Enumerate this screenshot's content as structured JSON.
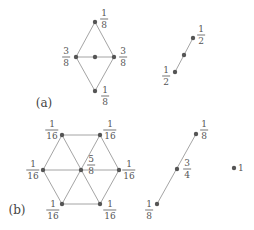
{
  "diagram": {
    "colors": {
      "edge": "#9a9a9a",
      "node": "#555555",
      "text": "#555555"
    },
    "panels": [
      {
        "label": "(a)",
        "label_pos": [
          44,
          103
        ],
        "figures": [
          {
            "name": "diamond",
            "nodes": [
              {
                "id": "top",
                "x": 95,
                "y": 22,
                "label": {
                  "num": "1",
                  "den": "8"
                },
                "lx": 104,
                "ly": 19
              },
              {
                "id": "left",
                "x": 76,
                "y": 57,
                "label": {
                  "num": "3",
                  "den": "8"
                },
                "lx": 66,
                "ly": 57
              },
              {
                "id": "center",
                "x": 95,
                "y": 57,
                "label": null
              },
              {
                "id": "right",
                "x": 114,
                "y": 57,
                "label": {
                  "num": "3",
                  "den": "8"
                },
                "lx": 123,
                "ly": 57
              },
              {
                "id": "bottom",
                "x": 95,
                "y": 91,
                "label": {
                  "num": "1",
                  "den": "8"
                },
                "lx": 105,
                "ly": 96
              }
            ],
            "edges": [
              [
                "top",
                "left"
              ],
              [
                "top",
                "right"
              ],
              [
                "left",
                "right"
              ],
              [
                "left",
                "bottom"
              ],
              [
                "right",
                "bottom"
              ]
            ]
          },
          {
            "name": "segment",
            "nodes": [
              {
                "id": "top",
                "x": 193,
                "y": 38,
                "label": {
                  "num": "1",
                  "den": "2"
                },
                "lx": 201,
                "ly": 35
              },
              {
                "id": "mid",
                "x": 184,
                "y": 55,
                "label": null
              },
              {
                "id": "bottom",
                "x": 175,
                "y": 72,
                "label": {
                  "num": "1",
                  "den": "2"
                },
                "lx": 166,
                "ly": 76
              }
            ],
            "edges": [
              [
                "top",
                "bottom"
              ]
            ]
          }
        ]
      },
      {
        "label": "(b)",
        "label_pos": [
          17,
          210
        ],
        "figures": [
          {
            "name": "hexagon",
            "nodes": [
              {
                "id": "tl",
                "x": 62,
                "y": 135,
                "label": {
                  "num": "1",
                  "den": "16"
                },
                "lx": 52,
                "ly": 130
              },
              {
                "id": "tr",
                "x": 100,
                "y": 135,
                "label": {
                  "num": "1",
                  "den": "16"
                },
                "lx": 110,
                "ly": 130
              },
              {
                "id": "l",
                "x": 43,
                "y": 170,
                "label": {
                  "num": "1",
                  "den": "16"
                },
                "lx": 33,
                "ly": 170
              },
              {
                "id": "c",
                "x": 81,
                "y": 170,
                "label": {
                  "num": "5",
                  "den": "8"
                },
                "lx": 91,
                "ly": 165
              },
              {
                "id": "r",
                "x": 119,
                "y": 170,
                "label": {
                  "num": "1",
                  "den": "16"
                },
                "lx": 129,
                "ly": 170
              },
              {
                "id": "bl",
                "x": 62,
                "y": 204,
                "label": {
                  "num": "1",
                  "den": "16"
                },
                "lx": 53,
                "ly": 210
              },
              {
                "id": "br",
                "x": 100,
                "y": 204,
                "label": {
                  "num": "1",
                  "den": "16"
                },
                "lx": 110,
                "ly": 210
              }
            ],
            "edges": [
              [
                "tl",
                "tr"
              ],
              [
                "tl",
                "l"
              ],
              [
                "tr",
                "r"
              ],
              [
                "l",
                "bl"
              ],
              [
                "r",
                "br"
              ],
              [
                "bl",
                "br"
              ],
              [
                "l",
                "r"
              ],
              [
                "tl",
                "br"
              ],
              [
                "tr",
                "bl"
              ]
            ]
          },
          {
            "name": "segment",
            "nodes": [
              {
                "id": "top",
                "x": 196,
                "y": 134,
                "label": {
                  "num": "1",
                  "den": "8"
                },
                "lx": 204,
                "ly": 130
              },
              {
                "id": "mid",
                "x": 177,
                "y": 169,
                "label": {
                  "num": "3",
                  "den": "4"
                },
                "lx": 187,
                "ly": 169
              },
              {
                "id": "bottom",
                "x": 157,
                "y": 204,
                "label": {
                  "num": "1",
                  "den": "8"
                },
                "lx": 149,
                "ly": 210
              }
            ],
            "edges": [
              [
                "top",
                "bottom"
              ]
            ]
          },
          {
            "name": "point",
            "nodes": [
              {
                "id": "p",
                "x": 234,
                "y": 168,
                "label": {
                  "plain": "1"
                },
                "lx": 238,
                "ly": 168
              }
            ],
            "edges": []
          }
        ]
      }
    ]
  }
}
